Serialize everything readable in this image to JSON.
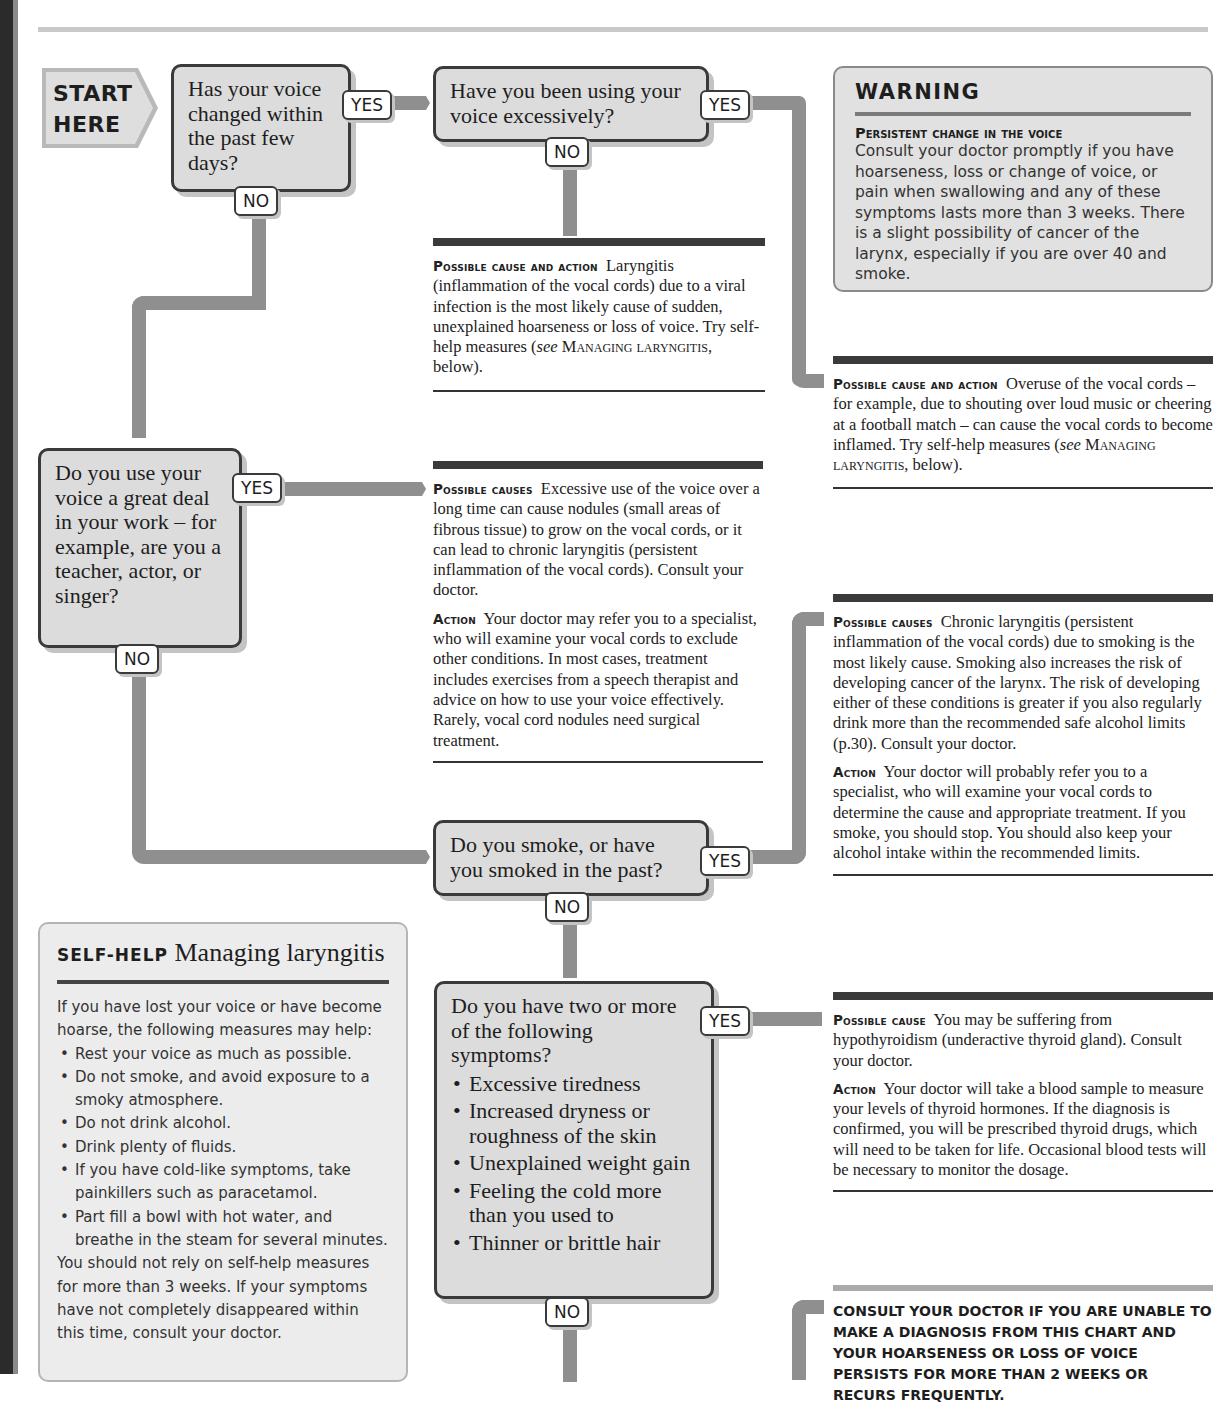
{
  "page": {
    "top_caption": "…symptoms … and … for … ; if … reply …",
    "colors": {
      "box_fill": "#dcdcdc",
      "box_border": "#3a3a3a",
      "connector": "#8f8f8f",
      "rule_dark": "#3a3a3a"
    }
  },
  "start": {
    "line1": "START",
    "line2": "HERE"
  },
  "labels": {
    "yes": "YES",
    "no": "NO"
  },
  "questions": [
    {
      "id": "q1",
      "text": "Has your voice changed within the past few days?"
    },
    {
      "id": "q2",
      "text": "Have you been using your voice excessively?"
    },
    {
      "id": "q3",
      "text": "Do you use your voice a great deal in your work – for example, are you a teacher, actor, or singer?"
    },
    {
      "id": "q4",
      "text": "Do you smoke, or have you smoked in the past?"
    },
    {
      "id": "q5",
      "intro": "Do you have two or more of the following symptoms?",
      "symptoms": [
        "Excessive tiredness",
        "Increased dryness or roughness of the skin",
        "Unexplained weight gain",
        "Feeling the cold more than you used to",
        "Thinner or brittle hair"
      ]
    }
  ],
  "warning": {
    "title": "WARNING",
    "subtitle": "Persistent change in the voice",
    "body": "Consult your doctor promptly if you have hoarseness, loss or change of voice, or pain when swallowing and any of these symptoms lasts more than 3 weeks. There is a slight possibility of cancer of the larynx, especially if you are over 40 and smoke."
  },
  "results": {
    "r1": {
      "label": "Possible cause and action",
      "text": "Laryngitis (inflammation of the vocal cords) due to a viral infection is the most likely cause of sudden, unexplained hoarseness or loss of voice. Try self-help measures (",
      "see": "see",
      "ref": "Managing laryngitis",
      "tail": ", below)."
    },
    "r2": {
      "label": "Possible cause and action",
      "text": "Overuse of the vocal cords – for example, due to shouting over loud music or cheering at a football match – can cause the vocal cords to become inflamed. Try self-help measures (",
      "see": "see",
      "ref": "Managing laryngitis",
      "tail": ", below)."
    },
    "r3": {
      "label": "Possible causes",
      "text": "Excessive use of the voice over a long time can cause nodules (small areas of fibrous tissue) to grow on the vocal cords, or it can lead to chronic laryngitis (persistent inflammation of the vocal cords). Consult your doctor.",
      "action_label": "Action",
      "action": "Your doctor may refer you to a specialist, who will examine your vocal cords to exclude other conditions. In most cases, treatment includes exercises from a speech therapist and advice on how to use your voice effectively. Rarely, vocal cord nodules need surgical treatment."
    },
    "r4": {
      "label": "Possible causes",
      "text": "Chronic laryngitis (persistent inflammation of the vocal cords) due to smoking is the most likely cause. Smoking also increases the risk of developing cancer of the larynx. The risk of developing either of these conditions is greater if you also regularly drink more than the recommended safe alcohol limits (p.30). Consult your doctor.",
      "action_label": "Action",
      "action": "Your doctor will probably refer you to a specialist, who will examine your vocal cords to determine the cause and appropriate treatment. If you smoke, you should stop. You should also keep your alcohol intake within the recommended limits."
    },
    "r5": {
      "label": "Possible cause",
      "text": "You may be suffering from hypothyroidism (underactive thyroid gland). Consult your doctor.",
      "action_label": "Action",
      "action": "Your doctor will take a blood sample to measure your levels of thyroid hormones. If the diagnosis is confirmed, you will be prescribed thyroid drugs, which will need to be taken for life. Occasional blood tests will be necessary to monitor the dosage."
    }
  },
  "selfhelp": {
    "keyword": "SELF-HELP",
    "title": "Managing laryngitis",
    "intro": "If you have lost your voice or have become hoarse, the following measures may help:",
    "items": [
      "Rest your voice as much as possible.",
      "Do not smoke, and avoid exposure to a smoky atmosphere.",
      "Do not drink alcohol.",
      "Drink plenty of fluids.",
      "If you have cold-like symptoms, take painkillers such as paracetamol.",
      "Part fill a bowl with hot water, and breathe in the steam for several minutes."
    ],
    "outro": "You should not rely on self-help measures for more than 3 weeks. If your symptoms have not completely disappeared within this time, consult your doctor."
  },
  "final": {
    "text": "CONSULT YOUR DOCTOR IF YOU ARE UNABLE TO MAKE A DIAGNOSIS FROM THIS CHART AND YOUR HOARSENESS OR LOSS OF VOICE PERSISTS FOR MORE THAN 2 WEEKS OR RECURS FREQUENTLY."
  }
}
